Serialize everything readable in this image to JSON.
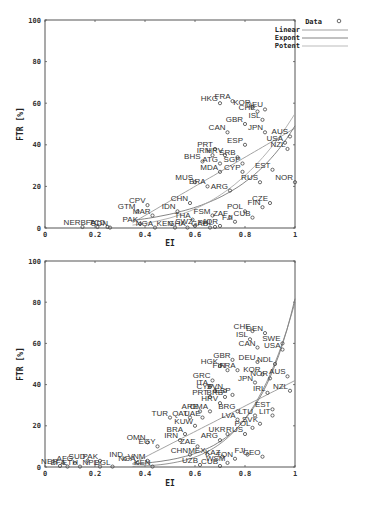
{
  "chart_data": [
    {
      "type": "scatter",
      "title": "",
      "xlabel": "EI",
      "ylabel": "FTR [%]",
      "xlim": [
        0,
        1
      ],
      "ylim": [
        0,
        100
      ],
      "x_ticks": [
        "0",
        "0.2",
        "0.4",
        "0.6",
        "0.8",
        "1"
      ],
      "y_ticks": [
        "0",
        "20",
        "40",
        "60",
        "80",
        "100"
      ],
      "legend": [
        "Data",
        "Linear",
        "Expont",
        "Potent"
      ],
      "legend_position": "top-right outside",
      "grid": false,
      "points": [
        {
          "label": "HKG",
          "x": 0.7,
          "y": 60
        },
        {
          "label": "FRA",
          "x": 0.75,
          "y": 61
        },
        {
          "label": "KOR",
          "x": 0.83,
          "y": 58
        },
        {
          "label": "CHE",
          "x": 0.85,
          "y": 56
        },
        {
          "label": "DEU",
          "x": 0.88,
          "y": 57
        },
        {
          "label": "ISL",
          "x": 0.87,
          "y": 52
        },
        {
          "label": "GBR",
          "x": 0.8,
          "y": 50
        },
        {
          "label": "CAN",
          "x": 0.73,
          "y": 46
        },
        {
          "label": "JPN",
          "x": 0.88,
          "y": 46
        },
        {
          "label": "AUS",
          "x": 0.98,
          "y": 44
        },
        {
          "label": "USA",
          "x": 0.96,
          "y": 41
        },
        {
          "label": "NZL",
          "x": 0.97,
          "y": 38
        },
        {
          "label": "ESP",
          "x": 0.8,
          "y": 40
        },
        {
          "label": "PRT",
          "x": 0.68,
          "y": 38
        },
        {
          "label": "IRN",
          "x": 0.67,
          "y": 35
        },
        {
          "label": "HRV",
          "x": 0.72,
          "y": 35
        },
        {
          "label": "SRB",
          "x": 0.77,
          "y": 34
        },
        {
          "label": "BHS",
          "x": 0.63,
          "y": 32
        },
        {
          "label": "ATG",
          "x": 0.7,
          "y": 31
        },
        {
          "label": "SGP",
          "x": 0.79,
          "y": 31
        },
        {
          "label": "MDA",
          "x": 0.7,
          "y": 27
        },
        {
          "label": "CYP",
          "x": 0.79,
          "y": 27
        },
        {
          "label": "EST",
          "x": 0.91,
          "y": 28
        },
        {
          "label": "RUS",
          "x": 0.86,
          "y": 22
        },
        {
          "label": "NOR",
          "x": 1.0,
          "y": 22
        },
        {
          "label": "MUS",
          "x": 0.6,
          "y": 22
        },
        {
          "label": "BRA",
          "x": 0.65,
          "y": 20
        },
        {
          "label": "ARG",
          "x": 0.74,
          "y": 18
        },
        {
          "label": "CHN",
          "x": 0.58,
          "y": 12
        },
        {
          "label": "CZE",
          "x": 0.9,
          "y": 12
        },
        {
          "label": "FIN",
          "x": 0.87,
          "y": 10
        },
        {
          "label": "POL",
          "x": 0.8,
          "y": 8
        },
        {
          "label": "CUB",
          "x": 0.83,
          "y": 5
        },
        {
          "label": "CPV",
          "x": 0.41,
          "y": 11
        },
        {
          "label": "GTM",
          "x": 0.37,
          "y": 8
        },
        {
          "label": "MAR",
          "x": 0.43,
          "y": 6
        },
        {
          "label": "IDN",
          "x": 0.53,
          "y": 8
        },
        {
          "label": "FSM",
          "x": 0.67,
          "y": 6
        },
        {
          "label": "ZAF",
          "x": 0.74,
          "y": 5
        },
        {
          "label": "FJI",
          "x": 0.76,
          "y": 3
        },
        {
          "label": "THA",
          "x": 0.59,
          "y": 4
        },
        {
          "label": "JOR",
          "x": 0.7,
          "y": 1
        },
        {
          "label": "PAK",
          "x": 0.38,
          "y": 2
        },
        {
          "label": "SWZ",
          "x": 0.6,
          "y": 1
        },
        {
          "label": "PHL",
          "x": 0.68,
          "y": 0.5
        },
        {
          "label": "NER",
          "x": 0.15,
          "y": 0.5
        },
        {
          "label": "BFA",
          "x": 0.21,
          "y": 0.5
        },
        {
          "label": "TCD",
          "x": 0.25,
          "y": 0.5
        },
        {
          "label": "SDN",
          "x": 0.26,
          "y": 0.2
        },
        {
          "label": "NGA",
          "x": 0.44,
          "y": 0.2
        },
        {
          "label": "KEN",
          "x": 0.52,
          "y": 0.2
        },
        {
          "label": "GHA",
          "x": 0.57,
          "y": 0.2
        },
        {
          "label": "GAB",
          "x": 0.66,
          "y": 0.2
        }
      ]
    },
    {
      "type": "scatter",
      "title": "",
      "xlabel": "EI",
      "ylabel": "FTR [%]",
      "xlim": [
        0,
        1
      ],
      "ylim": [
        0,
        100
      ],
      "x_ticks": [
        "0",
        "0.2",
        "0.4",
        "0.6",
        "0.8",
        "1"
      ],
      "y_ticks": [
        "0",
        "20",
        "40",
        "60",
        "80",
        "100"
      ],
      "grid": false,
      "points": [
        {
          "label": "CHE",
          "x": 0.83,
          "y": 66
        },
        {
          "label": "DEN",
          "x": 0.88,
          "y": 65
        },
        {
          "label": "ISL",
          "x": 0.82,
          "y": 62
        },
        {
          "label": "SWE",
          "x": 0.95,
          "y": 60
        },
        {
          "label": "CAN",
          "x": 0.85,
          "y": 58
        },
        {
          "label": "USA",
          "x": 0.95,
          "y": 57
        },
        {
          "label": "GBR",
          "x": 0.75,
          "y": 52
        },
        {
          "label": "DEU",
          "x": 0.85,
          "y": 51
        },
        {
          "label": "NDL",
          "x": 0.92,
          "y": 50
        },
        {
          "label": "HGK",
          "x": 0.7,
          "y": 49
        },
        {
          "label": "FIN",
          "x": 0.73,
          "y": 47
        },
        {
          "label": "FRA",
          "x": 0.77,
          "y": 47
        },
        {
          "label": "KOR",
          "x": 0.87,
          "y": 45
        },
        {
          "label": "AUS",
          "x": 0.97,
          "y": 44
        },
        {
          "label": "NOR",
          "x": 0.9,
          "y": 43
        },
        {
          "label": "JPN",
          "x": 0.84,
          "y": 41
        },
        {
          "label": "GRC",
          "x": 0.67,
          "y": 42
        },
        {
          "label": "ITA",
          "x": 0.66,
          "y": 39
        },
        {
          "label": "CYP",
          "x": 0.68,
          "y": 37
        },
        {
          "label": "SVN",
          "x": 0.72,
          "y": 37
        },
        {
          "label": "ESP",
          "x": 0.75,
          "y": 35
        },
        {
          "label": "IRL",
          "x": 0.89,
          "y": 36
        },
        {
          "label": "NZL",
          "x": 0.98,
          "y": 37
        },
        {
          "label": "PRT",
          "x": 0.66,
          "y": 34
        },
        {
          "label": "BRB",
          "x": 0.72,
          "y": 34
        },
        {
          "label": "HRV",
          "x": 0.7,
          "y": 31
        },
        {
          "label": "EST",
          "x": 0.91,
          "y": 28
        },
        {
          "label": "BRG",
          "x": 0.77,
          "y": 27
        },
        {
          "label": "LTU",
          "x": 0.84,
          "y": 25
        },
        {
          "label": "LIT",
          "x": 0.91,
          "y": 25
        },
        {
          "label": "ARE",
          "x": 0.62,
          "y": 27
        },
        {
          "label": "OMA",
          "x": 0.66,
          "y": 27
        },
        {
          "label": "TUR",
          "x": 0.5,
          "y": 24
        },
        {
          "label": "LVA",
          "x": 0.77,
          "y": 23
        },
        {
          "label": "QAT",
          "x": 0.58,
          "y": 24
        },
        {
          "label": "UAE",
          "x": 0.63,
          "y": 24
        },
        {
          "label": "SVK",
          "x": 0.86,
          "y": 21
        },
        {
          "label": "KUW",
          "x": 0.6,
          "y": 20
        },
        {
          "label": "POL",
          "x": 0.83,
          "y": 19
        },
        {
          "label": "BRA",
          "x": 0.56,
          "y": 16
        },
        {
          "label": "UKR",
          "x": 0.73,
          "y": 16
        },
        {
          "label": "RUS",
          "x": 0.8,
          "y": 16
        },
        {
          "label": "ARG",
          "x": 0.7,
          "y": 13
        },
        {
          "label": "IRN",
          "x": 0.54,
          "y": 13
        },
        {
          "label": "ZAE",
          "x": 0.61,
          "y": 10
        },
        {
          "label": "OMN",
          "x": 0.41,
          "y": 12
        },
        {
          "label": "EGY",
          "x": 0.45,
          "y": 10
        },
        {
          "label": "FJI",
          "x": 0.81,
          "y": 6
        },
        {
          "label": "GEO",
          "x": 0.87,
          "y": 5
        },
        {
          "label": "MEX",
          "x": 0.65,
          "y": 6
        },
        {
          "label": "KAZ",
          "x": 0.71,
          "y": 5
        },
        {
          "label": "TON",
          "x": 0.76,
          "y": 4
        },
        {
          "label": "WSM",
          "x": 0.73,
          "y": 2
        },
        {
          "label": "CHN",
          "x": 0.58,
          "y": 6
        },
        {
          "label": "UZB",
          "x": 0.62,
          "y": 1
        },
        {
          "label": "CUB",
          "x": 0.7,
          "y": 0.5
        },
        {
          "label": "IND",
          "x": 0.32,
          "y": 4
        },
        {
          "label": "VNM",
          "x": 0.41,
          "y": 3
        },
        {
          "label": "NGA",
          "x": 0.37,
          "y": 2
        },
        {
          "label": "PAK",
          "x": 0.22,
          "y": 3
        },
        {
          "label": "SUD",
          "x": 0.17,
          "y": 3
        },
        {
          "label": "AFG",
          "x": 0.12,
          "y": 2
        },
        {
          "label": "NER",
          "x": 0.06,
          "y": 0.5
        },
        {
          "label": "BFA",
          "x": 0.09,
          "y": 0.2
        },
        {
          "label": "ETH",
          "x": 0.14,
          "y": 0.2
        },
        {
          "label": "NPL",
          "x": 0.22,
          "y": 0.2
        },
        {
          "label": "BGL",
          "x": 0.27,
          "y": 0.2
        },
        {
          "label": "KEN",
          "x": 0.43,
          "y": 0.2
        }
      ]
    }
  ],
  "legend": {
    "items": [
      {
        "label": "Data",
        "symbol": "o"
      },
      {
        "label": "Linear",
        "symbol": "line"
      },
      {
        "label": "Expont",
        "symbol": "line"
      },
      {
        "label": "Potent",
        "symbol": "line"
      }
    ]
  },
  "axes": {
    "xlabel": "EI",
    "ylabel": "FTR [%]",
    "x_ticks": [
      "0",
      "0.2",
      "0.4",
      "0.6",
      "0.8",
      "1"
    ],
    "y_ticks": [
      "0",
      "20",
      "40",
      "60",
      "80",
      "100"
    ]
  },
  "colors": {
    "axis": "#555555",
    "marker": "#444444",
    "label": "#333333",
    "fit": "#888888"
  }
}
